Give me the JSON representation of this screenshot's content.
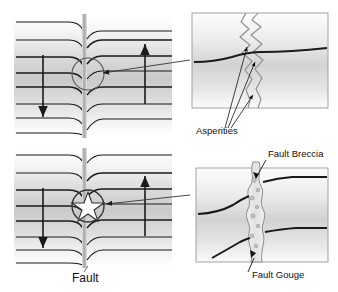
{
  "figure": {
    "title_label": "Fault",
    "background_color": "#ffffff",
    "line_color": "#1a1a1a",
    "fault_band_color": "#b8b8b8",
    "strata_shade_dark": "#c9c9c9",
    "strata_shade_light": "#f2f2f2",
    "inset_border_color": "#9a9a9a",
    "gouge_fill_color": "#e8e8e8"
  },
  "panels": {
    "upper_left": {
      "name": "fault-block-diagram-upper",
      "left_block_motion": "down",
      "right_block_motion": "up",
      "focus_marker": "circle",
      "strata_count": 8
    },
    "lower_left": {
      "name": "fault-block-diagram-lower",
      "left_block_motion": "down",
      "right_block_motion": "up",
      "focus_marker": "star-burst",
      "strata_count": 8
    },
    "upper_right_inset": {
      "name": "asperities-detail-inset",
      "label": "Asperities",
      "arrow_count": 3,
      "surface": "jagged-interlocking"
    },
    "lower_right_inset": {
      "name": "fault-zone-detail-inset",
      "labels": {
        "breccia": "Fault Breccia",
        "gouge": "Fault Gouge"
      },
      "surface": "crushed-rock-zone"
    }
  },
  "labels": {
    "fault": "Fault",
    "asperities": "Asperities",
    "fault_breccia": "Fault Breccia",
    "fault_gouge": "Fault Gouge"
  }
}
